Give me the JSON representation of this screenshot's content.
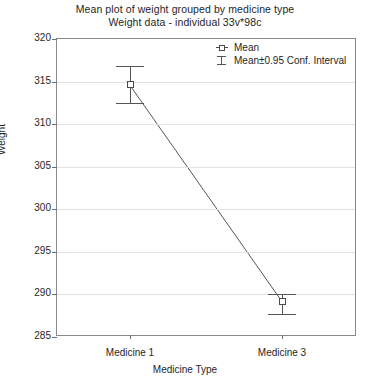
{
  "chart_data": {
    "type": "line",
    "title": "Mean plot of weight grouped by medicine type",
    "subtitle": "Weight data - individual 33v*98c",
    "xlabel": "Medicine Type",
    "ylabel": "Weight",
    "categories": [
      "Medicine 1",
      "Medicine 3"
    ],
    "series": [
      {
        "name": "Mean",
        "values": [
          314.6,
          289.2
        ],
        "ci_lower": [
          312.5,
          287.7
        ],
        "ci_upper": [
          316.8,
          290.1
        ]
      }
    ],
    "ylim": [
      285,
      320
    ],
    "yticks": [
      285,
      290,
      295,
      300,
      305,
      310,
      315,
      320
    ],
    "ytick_labels": [
      "285",
      "290",
      "295",
      "300",
      "305",
      "310",
      "315",
      "320"
    ],
    "grid": true,
    "legend_position": "top-right",
    "legend": [
      {
        "label": "Mean",
        "marker": "square-with-line"
      },
      {
        "label": "Mean±0.95 Conf. Interval",
        "marker": "error-bar"
      }
    ],
    "colors": {
      "line": "#555555",
      "marker_edge": "#4a4a4a",
      "marker_fill": "#ffffff",
      "grid": "#e2e2e2",
      "frame": "#8a8a8a",
      "text": "#262626"
    }
  }
}
